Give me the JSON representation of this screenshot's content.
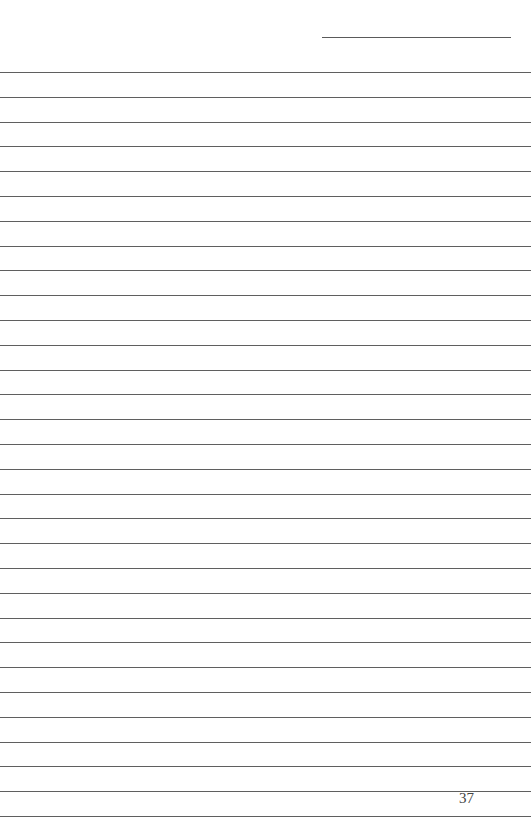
{
  "page": {
    "page_number": "37",
    "header_line": {
      "x": 322,
      "y": 37,
      "width": 189
    },
    "ruled_lines": {
      "count": 31,
      "first_y": 72,
      "spacing": 24.8,
      "width": 531
    },
    "colors": {
      "background": "#ffffff",
      "line": "#5f5f5f",
      "text": "#444444"
    }
  }
}
